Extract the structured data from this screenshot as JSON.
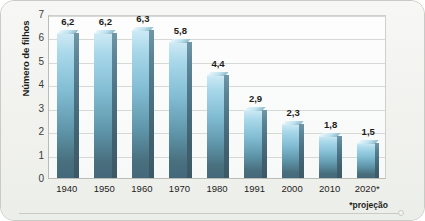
{
  "figure": {
    "credit": "Gráficos: Cassiano Róda/Arquivo da editora",
    "footnote": "*projeção"
  },
  "chart_data": {
    "type": "bar",
    "title": "",
    "subtitle": "",
    "xlabel": "",
    "ylabel": "Número de filhos",
    "categories": [
      "1940",
      "1950",
      "1960",
      "1970",
      "1980",
      "1991",
      "2000",
      "2010",
      "2020*"
    ],
    "values": [
      6.2,
      6.2,
      6.3,
      5.8,
      4.4,
      2.9,
      2.3,
      1.8,
      1.5
    ],
    "value_labels": [
      "6,2",
      "6,2",
      "6,3",
      "5,8",
      "4,4",
      "2,9",
      "2,3",
      "1,8",
      "1,5"
    ],
    "ylim": [
      0,
      7
    ],
    "yticks": [
      0,
      1,
      2,
      3,
      4,
      5,
      6,
      7
    ],
    "ytick_labels": [
      "0",
      "1",
      "2",
      "3",
      "4",
      "5",
      "6",
      "7"
    ],
    "grid": true,
    "legend": "none",
    "annotations": [
      "*projeção"
    ],
    "series_colors": {
      "bar_top": "#a9d8ea",
      "bar_bottom": "#44687a",
      "bar_side": "#4b7182"
    }
  }
}
